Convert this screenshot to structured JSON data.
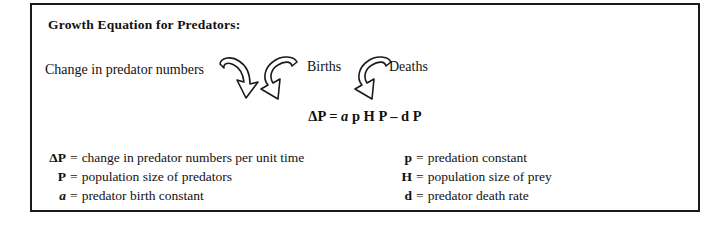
{
  "figure": {
    "title": "Growth Equation for Predators:",
    "flow": {
      "change_label": "Change in predator numbers",
      "births_label": "Births",
      "deaths_label": "Deaths",
      "arrow_change_name": "curved-arrow-down-right-icon",
      "arrow_births_name": "hook-arrow-down-icon",
      "arrow_deaths_name": "hook-arrow-down-icon"
    },
    "equation": {
      "delta_p": "ΔP",
      "equals": "=",
      "a": "a",
      "p": "p",
      "h": "H",
      "p_cap": "P",
      "minus": "–",
      "d": "d",
      "p_cap2": "P",
      "full": "ΔP = a p H P – d P"
    },
    "legend": {
      "left": [
        {
          "symbol": "ΔP",
          "equals": "=",
          "description": "change in predator numbers per unit time",
          "italic": false
        },
        {
          "symbol": "P",
          "equals": "=",
          "description": "population size of predators",
          "italic": false
        },
        {
          "symbol": "a",
          "equals": "=",
          "description": "predator birth constant",
          "italic": true
        }
      ],
      "right": [
        {
          "symbol": "p",
          "equals": "=",
          "description": "predation constant",
          "italic": false
        },
        {
          "symbol": "H",
          "equals": "=",
          "description": "population size of prey",
          "italic": false
        },
        {
          "symbol": "d",
          "equals": "=",
          "description": "predator death rate",
          "italic": false
        }
      ]
    },
    "colors": {
      "border": "#1a1a1a",
      "text": "#111111",
      "background": "#ffffff"
    }
  }
}
